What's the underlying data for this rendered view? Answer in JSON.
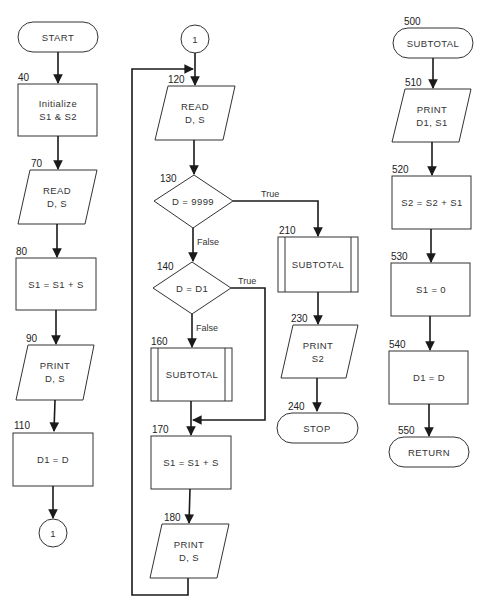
{
  "diagram": {
    "type": "flowchart",
    "main_program": {
      "start": {
        "label": "START"
      },
      "nodes": [
        {
          "id": "40",
          "shape": "process",
          "line1": "Initialize",
          "line2": "S1 & S2"
        },
        {
          "id": "70",
          "shape": "io",
          "line1": "READ",
          "line2": "D, S"
        },
        {
          "id": "80",
          "shape": "process",
          "line1": "S1 = S1 + S"
        },
        {
          "id": "90",
          "shape": "io",
          "line1": "PRINT",
          "line2": "D, S"
        },
        {
          "id": "110",
          "shape": "process",
          "line1": "D1 = D"
        }
      ],
      "connector_out": {
        "label": "1"
      }
    },
    "loop": {
      "connector_in": {
        "label": "1"
      },
      "n120": {
        "id": "120",
        "shape": "io",
        "line1": "READ",
        "line2": "D, S"
      },
      "n130": {
        "id": "130",
        "shape": "decision",
        "text": "D = 9999",
        "true_label": "True",
        "false_label": "False"
      },
      "n140": {
        "id": "140",
        "shape": "decision",
        "text": "D = D1",
        "true_label": "True",
        "false_label": "False"
      },
      "n160": {
        "id": "160",
        "shape": "predefined",
        "text": "SUBTOTAL"
      },
      "n170": {
        "id": "170",
        "shape": "process",
        "text": "S1 = S1 + S"
      },
      "n180": {
        "id": "180",
        "shape": "io",
        "line1": "PRINT",
        "line2": "D, S"
      },
      "n210": {
        "id": "210",
        "shape": "predefined",
        "text": "SUBTOTAL"
      },
      "n230": {
        "id": "230",
        "shape": "io",
        "line1": "PRINT",
        "line2": "S2"
      },
      "n240": {
        "id": "240",
        "shape": "terminal",
        "text": "STOP"
      }
    },
    "subroutine": {
      "n500": {
        "id": "500",
        "shape": "terminal",
        "text": "SUBTOTAL"
      },
      "n510": {
        "id": "510",
        "shape": "io",
        "line1": "PRINT",
        "line2": "D1, S1"
      },
      "n520": {
        "id": "520",
        "shape": "process",
        "text": "S2 = S2 + S1"
      },
      "n530": {
        "id": "530",
        "shape": "process",
        "text": "S1 = 0"
      },
      "n540": {
        "id": "540",
        "shape": "process",
        "text": "D1 = D"
      },
      "n550": {
        "id": "550",
        "shape": "terminal",
        "text": "RETURN"
      }
    }
  }
}
